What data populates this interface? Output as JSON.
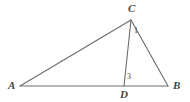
{
  "figure": {
    "name": "triangle-with-cevian",
    "background_color": "#ffffff",
    "line_color": "#6b6b6b",
    "label_color": "#444444",
    "line_width": 1.1,
    "vertices": [
      {
        "id": "A",
        "label": "A",
        "x": 20,
        "y": 86
      },
      {
        "id": "B",
        "label": "B",
        "x": 168,
        "y": 86
      },
      {
        "id": "C",
        "label": "C",
        "x": 131,
        "y": 20
      },
      {
        "id": "D",
        "label": "D",
        "x": 124,
        "y": 86
      }
    ],
    "segments": [
      {
        "id": "AB",
        "from": "A",
        "to": "B"
      },
      {
        "id": "AC",
        "from": "A",
        "to": "C"
      },
      {
        "id": "CB",
        "from": "C",
        "to": "B"
      },
      {
        "id": "CD",
        "from": "C",
        "to": "D"
      }
    ],
    "angle_labels": [
      {
        "id": "angle-1",
        "label": "1",
        "at_vertex": "C",
        "x": 134,
        "y": 27
      },
      {
        "id": "angle-3",
        "label": "3",
        "at_vertex": "D",
        "x": 127,
        "y": 73
      }
    ]
  }
}
